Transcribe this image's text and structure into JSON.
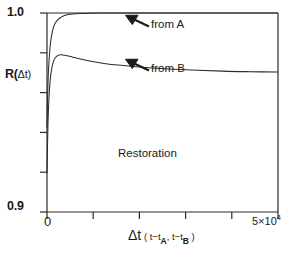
{
  "figure": {
    "name": "restoration-ratio-plot",
    "background_color": "#ffffff",
    "line_color": "#2b2b2b"
  },
  "axes": {
    "y_label": "R(",
    "y_label_arg": "Δt)",
    "y_tick_top": "1.0",
    "y_tick_bottom": "0.9",
    "x_tick_origin": "0",
    "x_tick_max_mantissa": "5×10",
    "x_tick_max_exponent": "4",
    "x_label_main": "Δt",
    "x_label_paren_open": " ( t−t",
    "x_label_sub_a": "A",
    "x_label_mid": ", t−t",
    "x_label_sub_b": "B",
    "x_label_paren_close": " )"
  },
  "annotations": {
    "curve_a_label": "from A",
    "curve_b_label": "from B",
    "region_label": "Restoration"
  },
  "chart_data": {
    "type": "line",
    "title": "",
    "xlabel": "Δt (t−t_A, t−t_B)",
    "ylabel": "R(Δt)",
    "xlim": [
      0,
      50000
    ],
    "ylim": [
      0.9,
      1.0
    ],
    "xticks": [
      0,
      10000,
      20000,
      30000,
      40000,
      50000
    ],
    "xtick_labels": [
      "0",
      "",
      "",
      "",
      "",
      "5×10^4"
    ],
    "yticks": [
      0.9,
      0.92,
      0.94,
      0.96,
      0.98,
      1.0
    ],
    "ytick_labels": [
      "0.9",
      "",
      "",
      "",
      "",
      "1.0"
    ],
    "grid": false,
    "legend": "annotated-inline",
    "series": [
      {
        "name": "from A",
        "label": "from A",
        "x": [
          0,
          200,
          400,
          700,
          1000,
          1400,
          1800,
          2400,
          3000,
          3800,
          4600,
          5600,
          7000,
          9000,
          12000,
          16000,
          22000,
          30000,
          38000,
          44000,
          50000
        ],
        "values": [
          0.9425,
          0.964,
          0.9745,
          0.9838,
          0.9888,
          0.9928,
          0.995,
          0.9968,
          0.9978,
          0.9987,
          0.9992,
          0.9995,
          0.9997,
          0.9999,
          1.0,
          1.0,
          1.0,
          1.0,
          1.0,
          1.0,
          1.0
        ]
      },
      {
        "name": "from B",
        "label": "from B",
        "x": [
          0,
          200,
          400,
          700,
          1000,
          1400,
          1800,
          2400,
          3000,
          3800,
          4600,
          5600,
          7000,
          9000,
          12000,
          16000,
          22000,
          30000,
          38000,
          44000,
          50000
        ],
        "values": [
          0.9195,
          0.943,
          0.956,
          0.9665,
          0.9718,
          0.9757,
          0.9775,
          0.9787,
          0.979,
          0.9788,
          0.9784,
          0.9778,
          0.977,
          0.976,
          0.9748,
          0.9737,
          0.9725,
          0.9715,
          0.9708,
          0.9705,
          0.9703
        ]
      }
    ],
    "region_annotation": "Restoration"
  }
}
